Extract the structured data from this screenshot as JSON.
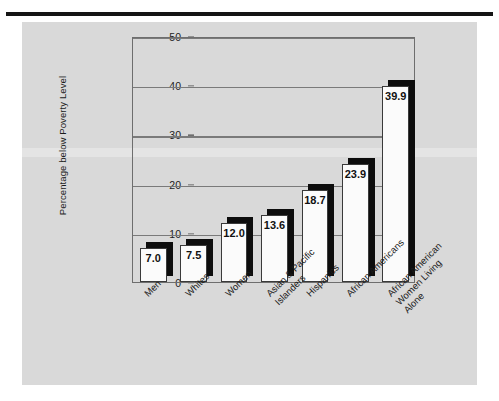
{
  "figure": {
    "panel_bg": "#d9d9d9",
    "rule_color": "#151515"
  },
  "chart_data": {
    "type": "bar",
    "title": "",
    "xlabel": "",
    "ylabel": "Percentage below Poverty Level",
    "ylim": [
      0,
      50
    ],
    "yticks": [
      0,
      10,
      20,
      30,
      40,
      50
    ],
    "ytick_labels": [
      "0",
      "10",
      "20",
      "30",
      "40",
      "50"
    ],
    "grid": true,
    "legend": "none",
    "categories": [
      "Men",
      "Whites",
      "Women",
      "Asian & Pacific Islanders",
      "Hispanics",
      "African Americans",
      "African American Women Living Alone"
    ],
    "category_lines": [
      [
        "Men"
      ],
      [
        "Whites"
      ],
      [
        "Women"
      ],
      [
        "Asian & Pacific",
        "Islanders"
      ],
      [
        "Hispanics"
      ],
      [
        "African Americans"
      ],
      [
        "African American",
        "Women Living",
        "Alone"
      ]
    ],
    "values": [
      7.0,
      7.5,
      12.0,
      13.6,
      18.7,
      23.9,
      39.9
    ],
    "data_labels": [
      "7.0",
      "7.5",
      "12.0",
      "13.6",
      "18.7",
      "23.9",
      "39.9"
    ],
    "bar_style": {
      "face_color": "#fbfbfb",
      "edge_color": "#3a3a3a",
      "shadow_color": "#0d0d0d"
    }
  }
}
